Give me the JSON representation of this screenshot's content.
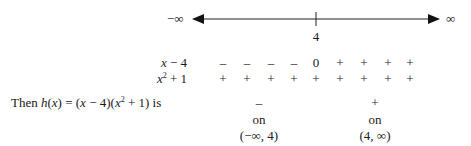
{
  "number_line": {
    "left_label": "−∞",
    "right_label": "∞",
    "tick_label": "4"
  },
  "sign_chart": {
    "rows": [
      {
        "label_var": "x",
        "label_rest": " − 4",
        "signs": [
          "–",
          "–",
          "–",
          "–",
          "0",
          "+",
          "+",
          "+",
          "+"
        ]
      },
      {
        "label_var": "x",
        "label_sup": "2",
        "label_rest": " + 1",
        "signs": [
          "+",
          "+",
          "+",
          "+",
          "+",
          "+",
          "+",
          "+",
          "+"
        ]
      }
    ],
    "conclusion": {
      "prefix": "Then ",
      "h": "h",
      "x1": "x",
      "eq": ") = (",
      "x2": "x",
      "mid": " − 4)(",
      "x3": "x",
      "sup": "2",
      "end": " + 1) is"
    },
    "intervals": [
      {
        "sign": "–",
        "word": "on",
        "interval": "(−∞, 4)"
      },
      {
        "sign": "+",
        "word": "on",
        "interval": "(4, ∞)"
      }
    ]
  }
}
